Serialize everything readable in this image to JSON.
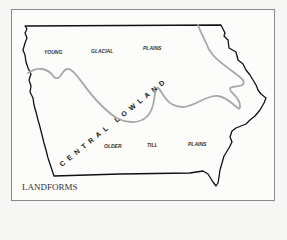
{
  "map": {
    "caption": "LANDFORMS",
    "region_labels": {
      "young_glacial": [
        "YOUNG",
        "GLACIAL",
        "PLAINS"
      ],
      "older_till": [
        "OLDER",
        "TILL",
        "PLAINS"
      ],
      "central_lowland": "CENTRAL LOWLAND"
    },
    "colors": {
      "state_border": "#111111",
      "region_boundary": "#a8a8a8",
      "frame": "#8a8a8a",
      "background": "#fcfcfb"
    }
  }
}
